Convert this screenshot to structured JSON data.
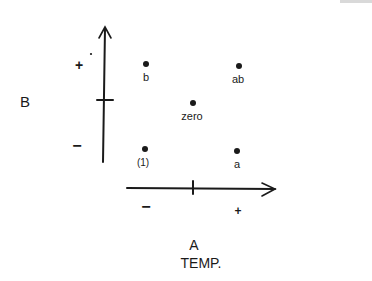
{
  "diagram": {
    "factor_a": {
      "letter": "A",
      "name": "TEMP.",
      "low": "−",
      "high": "+"
    },
    "factor_b": {
      "letter": "B",
      "low": "−",
      "high": "+"
    },
    "points": [
      {
        "label": "(1)",
        "a": "-",
        "b": "-"
      },
      {
        "label": "a",
        "a": "+",
        "b": "-"
      },
      {
        "label": "b",
        "a": "-",
        "b": "+"
      },
      {
        "label": "ab",
        "a": "+",
        "b": "+"
      },
      {
        "label": "zero",
        "a": "0",
        "b": "0"
      }
    ],
    "ink_color": "#1a1a1a"
  }
}
